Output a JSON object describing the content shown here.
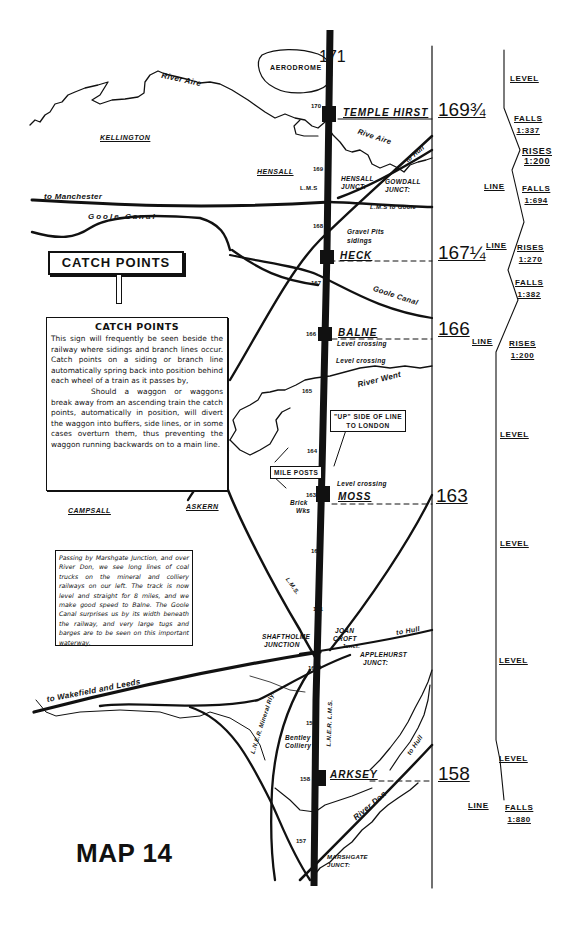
{
  "map": {
    "title": "MAP 14",
    "catch_sign": {
      "board_label": "CATCH POINTS"
    },
    "catch_points_box": {
      "heading": "CATCH POINTS",
      "paragraph_1": "This sign will frequently be seen beside the railway where sidings and branch lines occur. Catch points on a siding or branch line automatically spring back into position behind each wheel of a train as it passes by,",
      "paragraph_2": "Should a waggon or waggons break away from an ascending train the catch points, automatically in position, will divert the waggon into buffers, side lines, or in some cases overturn them, thus preventing the waggon running backwards on to a main line."
    },
    "journey_note": "Passing by Marshgate Junction, and over River Don, we see long lines of coal trucks on the mineral and colliery railways on our left. The track is now level and straight for 8 miles, and we make good speed to Balne. The Goole Canal surprises us by its width beneath the railway, and very large tugs and barges are to be seen on this important waterway.",
    "callouts": {
      "up_side": "\"UP\" SIDE OF LINE TO LONDON",
      "up_side_line1": "\"UP\" SIDE OF LINE",
      "up_side_line2": "TO LONDON",
      "mile_posts": "MILE POSTS"
    },
    "places": {
      "aerodrome": "AERODROME",
      "kellington": "KELLINGTON",
      "hensall": "HENSALL",
      "campsall": "CAMPSALL",
      "askern": "ASKERN"
    },
    "waterways": {
      "river_aire_west": "River Aire",
      "river_aire_east": "Rive Aire",
      "goole_canal_west": "Goole Canal",
      "goole_canal_east": "Goole Canal",
      "river_went": "River Went",
      "river_don": "River Don"
    },
    "routes": {
      "to_manchester": "to Manchester",
      "to_hull_north": "to Hull",
      "lms_to_goole": "L.M.S to Goole",
      "lms_north": "L.M.S",
      "to_hull_mid": "to Hull",
      "to_wakefield_leeds": "to Wakefield and Leeds",
      "lms_sw": "L.M.S.",
      "lner_mineral": "L.N.E.R. Mineral Rly.",
      "lner_lms": "L.N.E.R.  L.M.S.",
      "to_hull_south": "to Hull"
    },
    "junctions": {
      "hensall": "HENSALL JUNCT:",
      "hensall_l1": "HENSALL",
      "hensall_l2": "JUNCT:",
      "gowdall_l1": "GOWDALL",
      "gowdall_l2": "JUNCT:",
      "shaftholme_l1": "SHAFTHOLME",
      "shaftholme_l2": "JUNCTION",
      "joan_croft_l1": "JOAN",
      "joan_croft_l2": "CROFT",
      "joan_croft_l3": "Junct.",
      "applehurst_l1": "APPLEHURST",
      "applehurst_l2": "JUNCT:",
      "marshgate_l1": "MARSHGATE",
      "marshgate_l2": "JUNCT:"
    },
    "features": {
      "gravel_pits_l1": "Gravel Pits",
      "gravel_pits_l2": "sidings",
      "level_crossing_balne": "Level crossing",
      "level_crossing_2": "Level crossing",
      "level_crossing_moss": "Level crossing",
      "brick_works_l1": "Brick",
      "brick_works_l2": "Wks",
      "bentley_colliery_l1": "Bentley",
      "bentley_colliery_l2": "Colliery"
    },
    "stations": [
      {
        "name": "TEMPLE HIRST",
        "mile": "169¾"
      },
      {
        "name": "HECK",
        "mile": "167¼"
      },
      {
        "name": "BALNE",
        "mile": "166"
      },
      {
        "name": "MOSS",
        "mile": "163"
      },
      {
        "name": "ARKSEY",
        "mile": "158"
      }
    ],
    "mileposts": [
      "171",
      "170",
      "169",
      "168",
      "167",
      "166",
      "165",
      "164",
      "163",
      "162",
      "161",
      "160",
      "159",
      "158",
      "157"
    ]
  },
  "gradient_profile": {
    "entries": [
      {
        "prefix": "",
        "direction": "LEVEL",
        "ratio": ""
      },
      {
        "prefix": "",
        "direction": "FALLS",
        "ratio": "1:337"
      },
      {
        "prefix": "",
        "direction": "RISES",
        "ratio": "1:200"
      },
      {
        "prefix": "LINE",
        "direction": "FALLS",
        "ratio": "1:694"
      },
      {
        "prefix": "LINE",
        "direction": "RISES",
        "ratio": "1:270"
      },
      {
        "prefix": "",
        "direction": "FALLS",
        "ratio": "1:382"
      },
      {
        "prefix": "LINE",
        "direction": "RISES",
        "ratio": "1:200"
      },
      {
        "prefix": "",
        "direction": "LEVEL",
        "ratio": ""
      },
      {
        "prefix": "",
        "direction": "LEVEL",
        "ratio": ""
      },
      {
        "prefix": "",
        "direction": "LEVEL",
        "ratio": ""
      },
      {
        "prefix": "",
        "direction": "LEVEL",
        "ratio": ""
      },
      {
        "prefix": "LINE",
        "direction": "FALLS",
        "ratio": "1:880"
      }
    ]
  }
}
